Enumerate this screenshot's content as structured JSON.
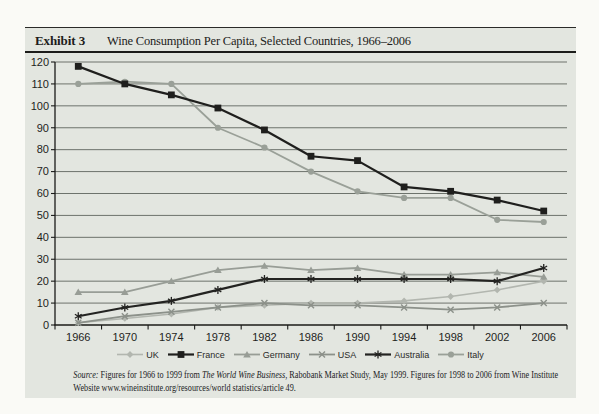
{
  "page": {
    "background": "#fafaf6"
  },
  "panel": {
    "background": "#e3e6e0"
  },
  "header": {
    "exhibit_label": "Exhibit 3",
    "title": "Wine Consumption Per Capita, Selected Countries, 1966–2006"
  },
  "chart_data": {
    "type": "line",
    "title": "Wine Consumption Per Capita, Selected Countries, 1966–2006",
    "xlabel": "",
    "ylabel": "",
    "categories": [
      "1966",
      "1970",
      "1974",
      "1978",
      "1982",
      "1986",
      "1990",
      "1994",
      "1998",
      "2002",
      "2006"
    ],
    "series": [
      {
        "name": "UK",
        "marker": "diamond",
        "color": "#b2b6af",
        "line_width": 1.6,
        "values": [
          1,
          3,
          5,
          8,
          9,
          10,
          10,
          11,
          13,
          16,
          20
        ]
      },
      {
        "name": "France",
        "marker": "square",
        "color": "#1f1f1d",
        "line_width": 2.2,
        "values": [
          118,
          110,
          105,
          99,
          89,
          77,
          75,
          63,
          61,
          57,
          52
        ]
      },
      {
        "name": "Germany",
        "marker": "triangle",
        "color": "#989d96",
        "line_width": 1.8,
        "values": [
          15,
          15,
          20,
          25,
          27,
          25,
          26,
          23,
          23,
          24,
          22
        ]
      },
      {
        "name": "USA",
        "marker": "x",
        "color": "#8c918a",
        "line_width": 1.8,
        "values": [
          1,
          4,
          6,
          8,
          10,
          9,
          9,
          8,
          7,
          8,
          10
        ]
      },
      {
        "name": "Australia",
        "marker": "asterisk",
        "color": "#232321",
        "line_width": 2.2,
        "values": [
          4,
          8,
          11,
          16,
          21,
          21,
          21,
          21,
          21,
          20,
          26
        ]
      },
      {
        "name": "Italy",
        "marker": "circle",
        "color": "#9aa098",
        "line_width": 1.8,
        "values": [
          110,
          111,
          110,
          90,
          81,
          70,
          61,
          58,
          58,
          48,
          47
        ]
      }
    ],
    "ylim": [
      0,
      120
    ],
    "ytick_step": 10,
    "grid": true,
    "grid_color": "#60655f",
    "axis_color": "#1b1b19",
    "legend_position": "bottom"
  },
  "source": {
    "label": "Source:",
    "line1_after_label": " Figures for 1966 to 1999 from ",
    "work_title": "The World Wine Business",
    "line1_rest": ", Rabobank Market Study, May 1999. Figures for 1998 to 2006 from Wine Institute",
    "line2": "Website www.wineinstitute.org/resources/world statistics/article 49."
  }
}
